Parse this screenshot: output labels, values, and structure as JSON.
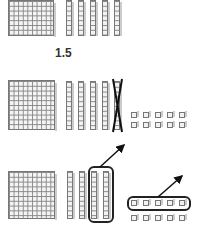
{
  "figure": {
    "type": "base-ten blocks subtraction illustration",
    "row1": {
      "flats": 1,
      "rods": 5,
      "label": "1.5"
    },
    "row2": {
      "flats": 1,
      "rods": 4,
      "crossed_rods": 1,
      "units": 10
    },
    "row3": {
      "flats": 1,
      "rods": 4,
      "circled_rods": 2,
      "units": 10,
      "circled_units": 5
    }
  }
}
